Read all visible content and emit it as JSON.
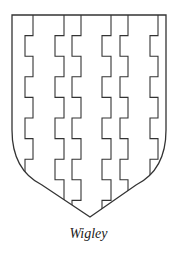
{
  "figure": {
    "title": "Wigley",
    "colors": {
      "background": "#ffffff",
      "line": "#333333"
    },
    "shield": {
      "left": 12,
      "right": 166,
      "top": 15,
      "side_bottom": 130,
      "point_x": 90,
      "point_y": 217
    },
    "potent_lines": [
      {
        "left_x": 25,
        "right_x": 33
      },
      {
        "left_x": 55,
        "right_x": 64
      },
      {
        "left_x": 72,
        "right_x": 81
      },
      {
        "left_x": 102,
        "right_x": 111
      },
      {
        "left_x": 120,
        "right_x": 128
      },
      {
        "left_x": 150,
        "right_x": 158
      }
    ],
    "step_start_y": 15,
    "step_height": 20.6
  },
  "caption": {
    "label": "Wigley"
  }
}
